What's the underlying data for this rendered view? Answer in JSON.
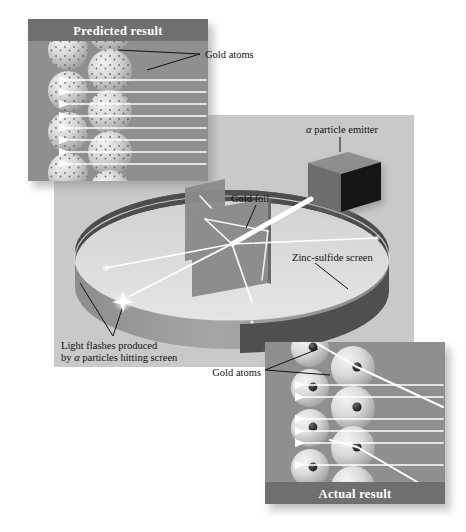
{
  "figure": {
    "background_color": "#ffffff"
  },
  "panels": {
    "predicted": {
      "title": "Predicted result",
      "title_band_color": "#6f6f6f",
      "body_color": "#8f8f8f",
      "atom_style": "speckled-sphere-no-nucleus",
      "beam_count": 8,
      "beam_behavior": "all particles pass straight through undeflected",
      "beam_color": "#ffffff"
    },
    "actual": {
      "title": "Actual result",
      "title_band_color": "#6f6f6f",
      "body_color": "#8f8f8f",
      "atom_style": "sphere-with-dense-dark-nucleus",
      "beam_count": 6,
      "deflected_count": 2,
      "beam_behavior": "most particles pass through; a few deflect sharply off nuclei",
      "beam_color": "#ffffff",
      "nucleus_color": "#3c3c3c"
    },
    "apparatus": {
      "background_color": "#c9c9c9"
    }
  },
  "labels": {
    "gold_atoms_top": "Gold atoms",
    "gold_atoms_bottom": "Gold atoms",
    "alpha_emitter_prefix": "α",
    "alpha_emitter_rest": " particle emitter",
    "gold_foil": "Gold foil",
    "zinc_sulfide_screen": "Zinc-sulfide screen",
    "light_flashes_line1": "Light flashes produced",
    "light_flashes_line2_pre": "by ",
    "light_flashes_line2_alpha": "α",
    "light_flashes_line2_post": " particles hitting screen"
  },
  "components": {
    "emitter": {
      "name": "alpha particle emitter",
      "shape": "cube",
      "top_face_color": "#8a8a8a",
      "left_face_color": "#6b6b6b",
      "right_face_color": "#141414"
    },
    "foil": {
      "name": "gold foil",
      "shape": "rectangular plate",
      "color": "#8a8a8a"
    },
    "screen": {
      "name": "zinc-sulfide screen",
      "shape": "circular ring / annulus",
      "front_color": "#9a9a9a",
      "back_color": "#4a4a4a",
      "floor_color": "#dcdcdc"
    },
    "flash": {
      "name": "light flash",
      "color": "#ffffff",
      "count": 2
    }
  }
}
